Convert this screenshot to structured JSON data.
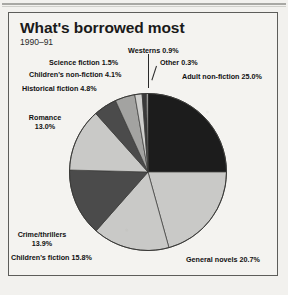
{
  "header": {
    "title": "What's borrowed most",
    "subtitle": "1990–91"
  },
  "chart_data": {
    "type": "pie",
    "title": "What's borrowed most",
    "subtitle": "1990–91",
    "xlabel": "",
    "ylabel": "",
    "units": "percent",
    "legend_position": "none",
    "grid": false,
    "labels": [
      "Adult non-fiction",
      "General novels",
      "Children's fiction",
      "Crime/thrillers",
      "Romance",
      "Historical fiction",
      "Children's non-fiction",
      "Science fiction",
      "Westerns",
      "Other"
    ],
    "values": [
      25.0,
      20.7,
      15.8,
      13.9,
      13.0,
      4.8,
      4.1,
      1.5,
      0.9,
      0.3
    ],
    "colors": [
      "#1c1c1c",
      "#c9c9c7",
      "#c9c9c7",
      "#4b4b4b",
      "#c9c9c7",
      "#4b4b4b",
      "#a3a3a1",
      "#cfcfcd",
      "#3a3a3a",
      "#d8d8d6"
    ],
    "slice_labels": [
      "Adult non-fiction 25.0%",
      "General novels 20.7%",
      "Children's fiction 15.8%",
      "Crime/thrillers 13.9%",
      "Romance 13.0%",
      "Historical fiction 4.8%",
      "Children's non-fiction 4.1%",
      "Science fiction 1.5%",
      "Westerns 0.9%",
      "Other 0.3%"
    ],
    "start_angle": 0,
    "direction": "clockwise"
  },
  "labels": {
    "westerns": "Westerns 0.9%",
    "other": "Other 0.3%",
    "adult_non_fiction": "Adult non-fiction 25.0%",
    "science_fiction": "Science fiction 1.5%",
    "childrens_non_fiction": "Children's non-fiction 4.1%",
    "historical_fiction": "Historical fiction 4.8%",
    "romance": "Romance 13.0%",
    "crime_thrillers": "Crime/thrillers 13.9%",
    "childrens_fiction": "Children's fiction 15.8%",
    "general_novels": "General novels 20.7%"
  }
}
